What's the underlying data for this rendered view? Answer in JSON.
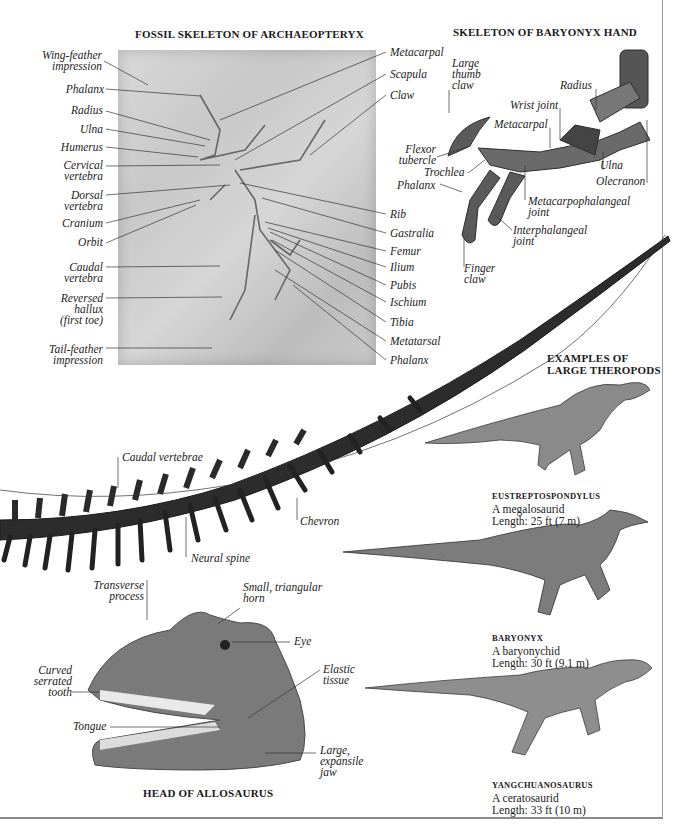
{
  "archaeopteryx": {
    "title": "FOSSIL SKELETON OF ARCHAEOPTERYX",
    "left_labels": [
      {
        "line1": "Wing-feather",
        "line2": "impression"
      },
      {
        "line1": "Phalanx"
      },
      {
        "line1": "Radius"
      },
      {
        "line1": "Ulna"
      },
      {
        "line1": "Humerus"
      },
      {
        "line1": "Cervical",
        "line2": "vertebra"
      },
      {
        "line1": "Dorsal",
        "line2": "vertebra"
      },
      {
        "line1": "Cranium"
      },
      {
        "line1": "Orbit"
      },
      {
        "line1": "Caudal",
        "line2": "vertebra"
      },
      {
        "line1": "Reversed",
        "line2": "hallux",
        "line3": "(first toe)"
      },
      {
        "line1": "Tail-feather",
        "line2": "impression"
      }
    ],
    "right_labels": [
      "Metacarpal",
      "Scapula",
      "Claw",
      "Rib",
      "Gastralia",
      "Femur",
      "Ilium",
      "Pubis",
      "Ischium",
      "Tibia",
      "Metatarsal",
      "Phalanx"
    ]
  },
  "baryonyx_hand": {
    "title": "SKELETON OF BARYONYX HAND",
    "labels": {
      "large_thumb_claw": [
        "Large",
        "thumb",
        "claw"
      ],
      "radius": "Radius",
      "wrist_joint": "Wrist joint",
      "metacarpal": "Metacarpal",
      "flexor_tubercle": [
        "Flexor",
        "tubercle"
      ],
      "trochlea": "Trochlea",
      "phalanx": "Phalanx",
      "ulna": "Ulna",
      "olecranon": "Olecranon",
      "metacarpophalangeal_joint": [
        "Metacarpophalangeal",
        "joint"
      ],
      "interphalangeal_joint": [
        "Interphalangeal",
        "joint"
      ],
      "finger_claw": [
        "Finger",
        "claw"
      ]
    }
  },
  "tail": {
    "labels": {
      "caudal_vertebrae": "Caudal vertebrae",
      "chevron": "Chevron",
      "neural_spine": "Neural spine",
      "transverse_process": [
        "Transverse",
        "process"
      ]
    }
  },
  "allosaurus_head": {
    "title": "HEAD OF ALLOSAURUS",
    "labels": {
      "horn": [
        "Small, triangular",
        "horn"
      ],
      "eye": "Eye",
      "curved_tooth": [
        "Curved",
        "serrated",
        "tooth"
      ],
      "elastic_tissue": [
        "Elastic",
        "tissue"
      ],
      "tongue": "Tongue",
      "jaw": [
        "Large,",
        "expansile",
        "jaw"
      ]
    }
  },
  "theropods": {
    "title_line1": "EXAMPLES OF",
    "title_line2": "LARGE THEROPODS",
    "items": [
      {
        "name": "EUSTREPTOSPONDYLUS",
        "family": "A megalosaurid",
        "length": "Length: 25 ft (7 m)"
      },
      {
        "name": "BARYONYX",
        "family": "A baryonychid",
        "length": "Length: 30 ft (9.1 m)"
      },
      {
        "name": "YANGCHUANOSAURUS",
        "family": "A ceratosaurid",
        "length": "Length: 33 ft (10 m)"
      }
    ]
  },
  "colors": {
    "ink": "#1a1a1a",
    "leader": "#333333",
    "bone": "#3a3a3a",
    "fossil_slab": "#cfcfcf",
    "frame": "#9a9a9a"
  }
}
